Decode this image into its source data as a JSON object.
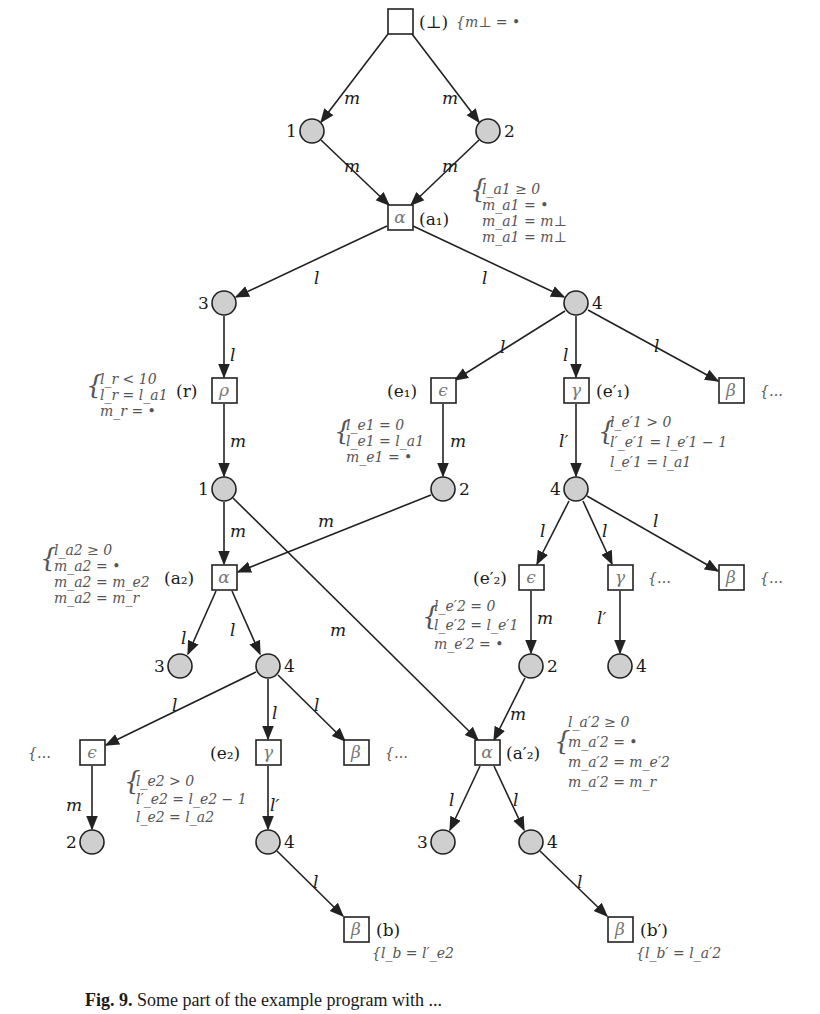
{
  "figure": {
    "caption_label": "Fig. 9.",
    "caption_text": "Some part of the example program with ..."
  },
  "nodes": {
    "bottom_root": {
      "id": "⊥",
      "label": "(⊥)",
      "constraints": [
        "{m⊥ = •"
      ]
    },
    "n1_top": {
      "label": "1"
    },
    "n2_top": {
      "label": "2"
    },
    "a1": {
      "symbol": "α",
      "label": "(a₁)",
      "constraints": [
        "l_a1 ≥ 0",
        "m_a1 = •",
        "m_a1 = m⊥",
        "m_a1 = m⊥"
      ]
    },
    "n3_a": {
      "label": "3"
    },
    "n4_a": {
      "label": "4"
    },
    "r": {
      "symbol": "ρ",
      "label": "(r)",
      "constraints": [
        "l_r < 10",
        "l_r = l_a1",
        "m_r = •"
      ]
    },
    "e1": {
      "symbol": "ϵ",
      "label": "(e₁)",
      "constraints": [
        "l_e1 = 0",
        "l_e1 = l_a1",
        "m_e1 = •"
      ]
    },
    "e1p": {
      "symbol": "γ",
      "label": "(e′₁)",
      "constraints": [
        "l_e′1 > 0",
        "l′_e′1 = l_e′1 − 1",
        "l_e′1 = l_a1"
      ]
    },
    "beta_a": {
      "symbol": "β",
      "ellipsis": "{…"
    },
    "n1_b": {
      "label": "1"
    },
    "n2_b": {
      "label": "2"
    },
    "n4_b": {
      "label": "4"
    },
    "a2": {
      "symbol": "α",
      "label": "(a₂)",
      "constraints": [
        "l_a2 ≥ 0",
        "m_a2 = •",
        "m_a2 = m_e2",
        "m_a2 = m_r"
      ]
    },
    "e2p": {
      "symbol": "ϵ",
      "label": "(e′₂)",
      "constraints": [
        "l_e′2 = 0",
        "l_e′2 = l_e′1",
        "m_e′2 = •"
      ]
    },
    "gamma_b": {
      "symbol": "γ",
      "ellipsis": "{…"
    },
    "beta_b": {
      "symbol": "β",
      "ellipsis": "{…"
    },
    "n3_c": {
      "label": "3"
    },
    "n4_c": {
      "label": "4"
    },
    "n2_c": {
      "label": "2"
    },
    "n4_d": {
      "label": "4"
    },
    "eps_c": {
      "symbol": "ϵ",
      "ellipsis": "{…"
    },
    "e2": {
      "symbol": "γ",
      "label": "(e₂)",
      "constraints": [
        "l_e2 > 0",
        "l′_e2 = l_e2 − 1",
        "l_e2 = l_a2"
      ]
    },
    "beta_c": {
      "symbol": "β",
      "ellipsis": "{…"
    },
    "a2p": {
      "symbol": "α",
      "label": "(a′₂)",
      "constraints": [
        "l_a′2 ≥ 0",
        "m_a′2 = •",
        "m_a′2 = m_e′2",
        "m_a′2 = m_r"
      ]
    },
    "n2_d": {
      "label": "2"
    },
    "n4_e": {
      "label": "4"
    },
    "n3_d": {
      "label": "3"
    },
    "n4_f": {
      "label": "4"
    },
    "b": {
      "symbol": "β",
      "label": "(b)",
      "constraints": [
        "{l_b = l′_e2"
      ]
    },
    "bp": {
      "symbol": "β",
      "label": "(b′)",
      "constraints": [
        "{l_b′ = l_a′2"
      ]
    }
  },
  "edge_labels": {
    "m": "m",
    "l": "l",
    "lp": "l′"
  },
  "colors": {
    "place_fill": "#cfcfcf",
    "stroke": "#222222",
    "constraint_text": "#555555"
  }
}
